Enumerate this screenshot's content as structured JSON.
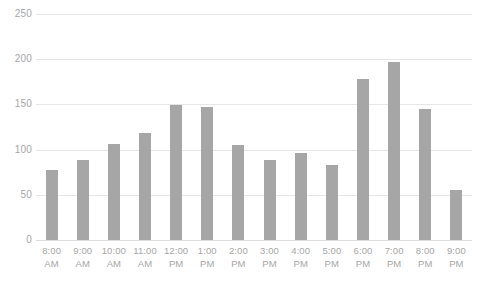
{
  "chart_data": {
    "type": "bar",
    "title": "",
    "subtitle": "",
    "xlabel": "",
    "ylabel": "",
    "ylim": [
      0,
      250
    ],
    "yticks": [
      0,
      50,
      100,
      150,
      200,
      250
    ],
    "grid": true,
    "legend": false,
    "legend_position": "none",
    "bar_color": "#a6a6a6",
    "gridline_color": "#e6e6e6",
    "label_color": "#a6a6a6",
    "background_color": "#ffffff",
    "categories": [
      "8:00 AM",
      "9:00 AM",
      "10:00 AM",
      "11:00 AM",
      "12:00 PM",
      "1:00 PM",
      "2:00 PM",
      "3:00 PM",
      "4:00 PM",
      "5:00 PM",
      "6:00 PM",
      "7:00 PM",
      "8:00 PM",
      "9:00 PM"
    ],
    "category_lines": [
      [
        "8:00",
        "AM"
      ],
      [
        "9:00",
        "AM"
      ],
      [
        "10:00",
        "AM"
      ],
      [
        "11:00",
        "AM"
      ],
      [
        "12:00",
        "PM"
      ],
      [
        "1:00",
        "PM"
      ],
      [
        "2:00",
        "PM"
      ],
      [
        "3:00",
        "PM"
      ],
      [
        "4:00",
        "PM"
      ],
      [
        "5:00",
        "PM"
      ],
      [
        "6:00",
        "PM"
      ],
      [
        "7:00",
        "PM"
      ],
      [
        "8:00",
        "PM"
      ],
      [
        "9:00",
        "PM"
      ]
    ],
    "values": [
      77,
      88,
      106,
      118,
      149,
      147,
      105,
      88,
      96,
      83,
      178,
      197,
      145,
      55
    ]
  }
}
